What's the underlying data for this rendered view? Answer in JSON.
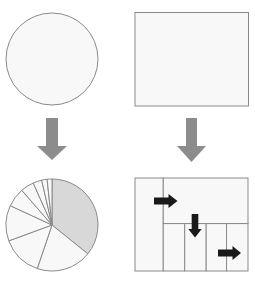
{
  "caption": {
    "text": ""
  },
  "colors": {
    "shape_fill": "#f8f8f8",
    "shape_stroke": "#8a8a8a",
    "highlight_fill": "#d8d8d8",
    "transition_arrow": "#8c8c8c",
    "flow_arrow": "#1a1a1a",
    "background": "#ffffff"
  },
  "left_column": {
    "top_shape": "circle",
    "transition": "down-arrow",
    "bottom_shape": "pie-chart"
  },
  "right_column": {
    "top_shape": "rectangle",
    "transition": "down-arrow",
    "bottom_shape": "treemap"
  },
  "chart_data": [
    {
      "type": "pie",
      "title": "",
      "start_angle": "12 o'clock",
      "direction": "clockwise",
      "categories": [
        "s1",
        "s2",
        "s3",
        "s4",
        "s5",
        "s6",
        "s7",
        "s8",
        "s9"
      ],
      "values": [
        35.8,
        19.4,
        14.2,
        12.5,
        6.7,
        4.7,
        3.1,
        1.9,
        1.7
      ],
      "highlighted": [
        0
      ],
      "labels_visible": false
    },
    {
      "type": "treemap",
      "title": "",
      "regions": [
        {
          "x": 0,
          "y": 0,
          "w": 25,
          "h": 100
        },
        {
          "x": 25,
          "y": 0,
          "w": 75,
          "h": 49
        },
        {
          "x": 25,
          "y": 49,
          "w": 19,
          "h": 51
        },
        {
          "x": 44,
          "y": 49,
          "w": 19,
          "h": 51
        },
        {
          "x": 63,
          "y": 49,
          "w": 18,
          "h": 51
        },
        {
          "x": 81,
          "y": 49,
          "w": 19,
          "h": 51
        }
      ],
      "flow_arrows": [
        "right",
        "down",
        "right"
      ]
    }
  ]
}
